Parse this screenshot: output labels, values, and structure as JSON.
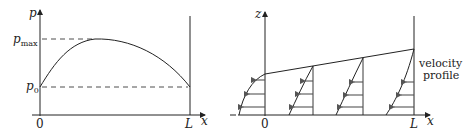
{
  "left_panel": {
    "y_axis_label": "p",
    "x_axis_label": "x",
    "origin_label": "0",
    "end_label": "L",
    "pmax_label": {
      "base": "p",
      "sub": "max"
    },
    "p0_label": {
      "base": "p",
      "sub": "0"
    },
    "curve": "pressure rises from p0 at x=0 to pmax then falls back to p0 at x=L"
  },
  "right_panel": {
    "z_axis_label": "z",
    "x_axis_label": "x",
    "origin_label": "0",
    "end_label": "L",
    "annotation_line1": "velocity",
    "annotation_line2": "profile",
    "profiles_count": 4,
    "arrows_per_profile": 3
  },
  "colors": {
    "line": "#222222",
    "arrow": "#555555"
  }
}
